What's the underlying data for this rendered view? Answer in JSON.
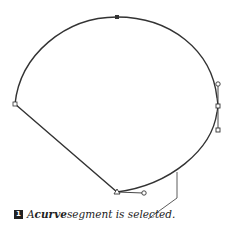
{
  "figure": {
    "step_number": "1",
    "caption_prefix": "A ",
    "caption_emphasis": "curve",
    "caption_suffix": " segment is selected.",
    "stroke_color": "#333333",
    "anchor_points": [
      {
        "name": "top",
        "x": 117,
        "y": 17,
        "selected": true
      },
      {
        "name": "left",
        "x": 15,
        "y": 104,
        "selected": false
      },
      {
        "name": "bottom",
        "x": 117,
        "y": 192,
        "selected": false
      },
      {
        "name": "right",
        "x": 218,
        "y": 106,
        "selected": false
      }
    ],
    "direction_handles": [
      {
        "from": [
          117,
          192
        ],
        "to": [
          143,
          193
        ]
      },
      {
        "from": [
          218,
          106
        ],
        "to": [
          218,
          85
        ]
      },
      {
        "from": [
          218,
          106
        ],
        "to": [
          218,
          130
        ]
      }
    ]
  }
}
